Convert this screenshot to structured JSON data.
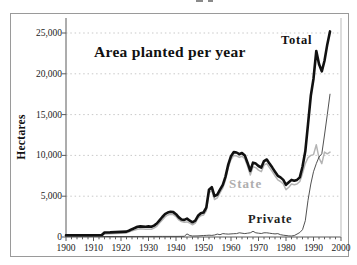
{
  "figure": {
    "title": "Area planted per year",
    "ylabel": "Hectares"
  },
  "colors": {
    "total_line": "#111111",
    "state_line": "#b4b4b4",
    "private_line": "#3d3d3d",
    "grid": "#c9c9c9",
    "axis": "#5a5a5a",
    "right_border": "#bbbbbb",
    "frame": "#9a9a9a",
    "text": "#1a1a1a"
  },
  "chart_data": {
    "type": "line",
    "title": "Area planted per year",
    "xlabel": "",
    "ylabel": "Hectares",
    "xlim": [
      1900,
      2000
    ],
    "ylim": [
      0,
      25000
    ],
    "x_ticks": [
      1900,
      1910,
      1920,
      1930,
      1940,
      1950,
      1960,
      1970,
      1980,
      1990,
      2000
    ],
    "x_minor_tick_step": 2,
    "y_ticks": [
      0,
      5000,
      10000,
      15000,
      20000,
      25000
    ],
    "y_tick_labels": [
      "0",
      "5,000",
      "10,000",
      "15,000",
      "20,000",
      "25,000"
    ],
    "grid": "horizontal-dotted",
    "legend": "inline-labels",
    "series": [
      {
        "name": "Total",
        "color": "#111111",
        "width": 2.6,
        "points": [
          [
            1900,
            200
          ],
          [
            1904,
            200
          ],
          [
            1908,
            200
          ],
          [
            1912,
            220
          ],
          [
            1913,
            250
          ],
          [
            1914,
            550
          ],
          [
            1916,
            560
          ],
          [
            1918,
            600
          ],
          [
            1920,
            620
          ],
          [
            1922,
            660
          ],
          [
            1923,
            800
          ],
          [
            1924,
            950
          ],
          [
            1925,
            1100
          ],
          [
            1926,
            1250
          ],
          [
            1927,
            1300
          ],
          [
            1929,
            1250
          ],
          [
            1930,
            1300
          ],
          [
            1931,
            1250
          ],
          [
            1932,
            1400
          ],
          [
            1933,
            1650
          ],
          [
            1934,
            2050
          ],
          [
            1935,
            2450
          ],
          [
            1936,
            2800
          ],
          [
            1937,
            3000
          ],
          [
            1938,
            3100
          ],
          [
            1939,
            3050
          ],
          [
            1940,
            2800
          ],
          [
            1941,
            2400
          ],
          [
            1942,
            2150
          ],
          [
            1943,
            2100
          ],
          [
            1944,
            2250
          ],
          [
            1945,
            2000
          ],
          [
            1946,
            1800
          ],
          [
            1947,
            2000
          ],
          [
            1948,
            2600
          ],
          [
            1949,
            2900
          ],
          [
            1950,
            3000
          ],
          [
            1951,
            3600
          ],
          [
            1952,
            5800
          ],
          [
            1953,
            6100
          ],
          [
            1954,
            5000
          ],
          [
            1955,
            5200
          ],
          [
            1956,
            5800
          ],
          [
            1957,
            6400
          ],
          [
            1958,
            7400
          ],
          [
            1959,
            8900
          ],
          [
            1960,
            9900
          ],
          [
            1961,
            10400
          ],
          [
            1962,
            10350
          ],
          [
            1963,
            10150
          ],
          [
            1964,
            10300
          ],
          [
            1965,
            10000
          ],
          [
            1966,
            9100
          ],
          [
            1967,
            8100
          ],
          [
            1968,
            9100
          ],
          [
            1969,
            9000
          ],
          [
            1970,
            8700
          ],
          [
            1971,
            8500
          ],
          [
            1972,
            9300
          ],
          [
            1973,
            9500
          ],
          [
            1974,
            9000
          ],
          [
            1975,
            8500
          ],
          [
            1976,
            8000
          ],
          [
            1977,
            7500
          ],
          [
            1978,
            7300
          ],
          [
            1979,
            7000
          ],
          [
            1980,
            6400
          ],
          [
            1981,
            6700
          ],
          [
            1982,
            7000
          ],
          [
            1983,
            6900
          ],
          [
            1984,
            7000
          ],
          [
            1985,
            7300
          ],
          [
            1986,
            8600
          ],
          [
            1987,
            10500
          ],
          [
            1988,
            13800
          ],
          [
            1989,
            17300
          ],
          [
            1990,
            19400
          ],
          [
            1991,
            22800
          ],
          [
            1992,
            21200
          ],
          [
            1993,
            20300
          ],
          [
            1994,
            21600
          ],
          [
            1995,
            23600
          ],
          [
            1996,
            25200
          ]
        ]
      },
      {
        "name": "State",
        "color": "#b4b4b4",
        "width": 1.5,
        "points": [
          [
            1900,
            100
          ],
          [
            1908,
            100
          ],
          [
            1912,
            120
          ],
          [
            1913,
            150
          ],
          [
            1914,
            380
          ],
          [
            1918,
            430
          ],
          [
            1920,
            450
          ],
          [
            1922,
            500
          ],
          [
            1923,
            620
          ],
          [
            1924,
            750
          ],
          [
            1925,
            850
          ],
          [
            1926,
            950
          ],
          [
            1927,
            1000
          ],
          [
            1929,
            950
          ],
          [
            1931,
            950
          ],
          [
            1932,
            1100
          ],
          [
            1933,
            1300
          ],
          [
            1934,
            1700
          ],
          [
            1935,
            2100
          ],
          [
            1936,
            2450
          ],
          [
            1937,
            2700
          ],
          [
            1938,
            2800
          ],
          [
            1939,
            2750
          ],
          [
            1940,
            2500
          ],
          [
            1941,
            2100
          ],
          [
            1942,
            1900
          ],
          [
            1943,
            1800
          ],
          [
            1944,
            1850
          ],
          [
            1945,
            1700
          ],
          [
            1946,
            1500
          ],
          [
            1947,
            1700
          ],
          [
            1948,
            2300
          ],
          [
            1949,
            2600
          ],
          [
            1950,
            2700
          ],
          [
            1951,
            3200
          ],
          [
            1952,
            5400
          ],
          [
            1953,
            5700
          ],
          [
            1954,
            4600
          ],
          [
            1955,
            4800
          ],
          [
            1956,
            5400
          ],
          [
            1957,
            6000
          ],
          [
            1958,
            7000
          ],
          [
            1959,
            8500
          ],
          [
            1960,
            9500
          ],
          [
            1961,
            10000
          ],
          [
            1962,
            9950
          ],
          [
            1963,
            9750
          ],
          [
            1964,
            9900
          ],
          [
            1965,
            9600
          ],
          [
            1966,
            8700
          ],
          [
            1967,
            7600
          ],
          [
            1968,
            8600
          ],
          [
            1969,
            8500
          ],
          [
            1970,
            8200
          ],
          [
            1971,
            8000
          ],
          [
            1972,
            8800
          ],
          [
            1973,
            9000
          ],
          [
            1974,
            8500
          ],
          [
            1975,
            8000
          ],
          [
            1976,
            7500
          ],
          [
            1977,
            7000
          ],
          [
            1978,
            6800
          ],
          [
            1979,
            6500
          ],
          [
            1980,
            5800
          ],
          [
            1981,
            6100
          ],
          [
            1982,
            6500
          ],
          [
            1983,
            6400
          ],
          [
            1984,
            6500
          ],
          [
            1985,
            6800
          ],
          [
            1986,
            7800
          ],
          [
            1987,
            9000
          ],
          [
            1988,
            9700
          ],
          [
            1989,
            10000
          ],
          [
            1990,
            10100
          ],
          [
            1991,
            11300
          ],
          [
            1992,
            9700
          ],
          [
            1993,
            9000
          ],
          [
            1994,
            10400
          ],
          [
            1995,
            10200
          ],
          [
            1996,
            10400
          ]
        ]
      },
      {
        "name": "Private",
        "color": "#3d3d3d",
        "width": 0.9,
        "points": [
          [
            1900,
            60
          ],
          [
            1920,
            60
          ],
          [
            1935,
            70
          ],
          [
            1940,
            70
          ],
          [
            1943,
            90
          ],
          [
            1944,
            380
          ],
          [
            1945,
            180
          ],
          [
            1946,
            120
          ],
          [
            1948,
            130
          ],
          [
            1950,
            180
          ],
          [
            1951,
            200
          ],
          [
            1952,
            220
          ],
          [
            1953,
            200
          ],
          [
            1954,
            250
          ],
          [
            1955,
            350
          ],
          [
            1956,
            280
          ],
          [
            1957,
            420
          ],
          [
            1958,
            380
          ],
          [
            1959,
            350
          ],
          [
            1960,
            380
          ],
          [
            1961,
            400
          ],
          [
            1962,
            420
          ],
          [
            1963,
            520
          ],
          [
            1964,
            460
          ],
          [
            1965,
            420
          ],
          [
            1966,
            470
          ],
          [
            1967,
            520
          ],
          [
            1968,
            700
          ],
          [
            1969,
            520
          ],
          [
            1970,
            470
          ],
          [
            1971,
            430
          ],
          [
            1972,
            520
          ],
          [
            1973,
            520
          ],
          [
            1974,
            470
          ],
          [
            1975,
            420
          ],
          [
            1976,
            380
          ],
          [
            1977,
            420
          ],
          [
            1978,
            280
          ],
          [
            1979,
            220
          ],
          [
            1980,
            180
          ],
          [
            1981,
            130
          ],
          [
            1982,
            120
          ],
          [
            1983,
            180
          ],
          [
            1984,
            350
          ],
          [
            1985,
            550
          ],
          [
            1986,
            900
          ],
          [
            1987,
            2000
          ],
          [
            1988,
            4500
          ],
          [
            1989,
            6500
          ],
          [
            1990,
            8000
          ],
          [
            1991,
            9000
          ],
          [
            1992,
            9800
          ],
          [
            1993,
            10200
          ],
          [
            1994,
            12500
          ],
          [
            1995,
            15000
          ],
          [
            1996,
            17500
          ]
        ]
      }
    ]
  }
}
